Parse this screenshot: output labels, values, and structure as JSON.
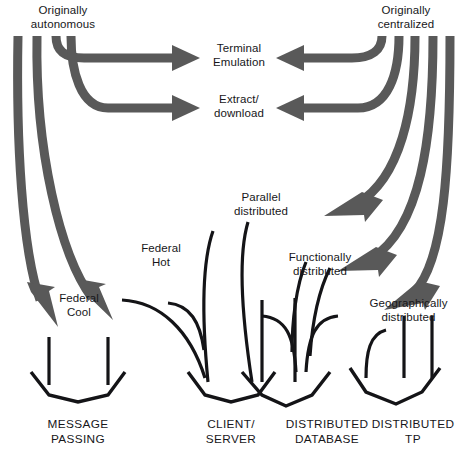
{
  "diagram": {
    "colors": {
      "thick_arrow": "#595959",
      "thin_line": "#141417",
      "background": "#ffffff",
      "text": "#17171a"
    },
    "sources": [
      {
        "id": "originally-autonomous",
        "label": "Originally\nautonomous"
      },
      {
        "id": "originally-centralized",
        "label": "Originally\ncentralized"
      }
    ],
    "intermediate_labels": [
      {
        "id": "terminal-emulation",
        "label": "Terminal\nEmulation"
      },
      {
        "id": "extract-download",
        "label": "Extract/\ndownload"
      },
      {
        "id": "parallel-distributed",
        "label": "Parallel\ndistributed"
      },
      {
        "id": "federal-hot",
        "label": "Federal\nHot"
      },
      {
        "id": "functionally-distributed",
        "label": "Functionally\ndistributed"
      },
      {
        "id": "federal-cool",
        "label": "Federal\nCool"
      },
      {
        "id": "geographically-distributed",
        "label": "Geographically\ndistributed"
      }
    ],
    "outcomes": [
      {
        "id": "message-passing",
        "label": "MESSAGE\nPASSING"
      },
      {
        "id": "client-server",
        "label": "CLIENT/\nSERVER"
      },
      {
        "id": "distributed-database",
        "label": "DISTRIBUTED\nDATABASE"
      },
      {
        "id": "distributed-tp",
        "label": "DISTRIBUTED\nTP"
      }
    ]
  }
}
